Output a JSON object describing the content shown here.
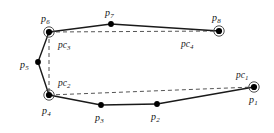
{
  "figure": {
    "kind": "polygon-with-control-points-diagram",
    "width": 274,
    "height": 133,
    "background_color": "#ffffff",
    "stroke_color": "#1a1a1a",
    "dash_color": "#555555",
    "vertex_fill": "#000000",
    "ring_stroke": "#4d4d4d"
  },
  "vertices": [
    {
      "id": "p1",
      "label": "p",
      "sub": "1",
      "x": 254,
      "y": 87,
      "ringed": true,
      "label_x": 249,
      "label_y": 95,
      "label_anchor": "below-left"
    },
    {
      "id": "p2",
      "label": "p",
      "sub": "2",
      "x": 157,
      "y": 104,
      "ringed": false,
      "label_x": 151,
      "label_y": 112,
      "label_anchor": "below"
    },
    {
      "id": "p3",
      "label": "p",
      "sub": "3",
      "x": 101,
      "y": 105,
      "ringed": false,
      "label_x": 95,
      "label_y": 113,
      "label_anchor": "below"
    },
    {
      "id": "p4",
      "label": "p",
      "sub": "4",
      "x": 49,
      "y": 95,
      "ringed": true,
      "label_x": 42,
      "label_y": 106,
      "label_anchor": "below"
    },
    {
      "id": "p5",
      "label": "p",
      "sub": "5",
      "x": 38,
      "y": 62,
      "ringed": false,
      "label_x": 20,
      "label_y": 60,
      "label_anchor": "left"
    },
    {
      "id": "p6",
      "label": "p",
      "sub": "6",
      "x": 49,
      "y": 32,
      "ringed": true,
      "label_x": 41,
      "label_y": 14,
      "label_anchor": "above"
    },
    {
      "id": "p7",
      "label": "p",
      "sub": "7",
      "x": 111,
      "y": 24,
      "ringed": false,
      "label_x": 105,
      "label_y": 8,
      "label_anchor": "above"
    },
    {
      "id": "p8",
      "label": "p",
      "sub": "8",
      "x": 219,
      "y": 31,
      "ringed": true,
      "label_x": 212,
      "label_y": 13,
      "label_anchor": "above"
    }
  ],
  "control_labels": [
    {
      "id": "pc1",
      "label": "pc",
      "sub": "1",
      "x": 236,
      "y": 71
    },
    {
      "id": "pc2",
      "label": "pc",
      "sub": "2",
      "x": 58,
      "y": 79
    },
    {
      "id": "pc3",
      "label": "pc",
      "sub": "3",
      "x": 58,
      "y": 41
    },
    {
      "id": "pc4",
      "label": "pc",
      "sub": "4",
      "x": 181,
      "y": 40
    }
  ],
  "solid_edges": [
    {
      "id": "edge-p6-p7",
      "from": "p6",
      "to": "p7"
    },
    {
      "id": "edge-p7-p8",
      "from": "p7",
      "to": "p8"
    },
    {
      "id": "edge-p6-p5",
      "from": "p6",
      "to": "p5"
    },
    {
      "id": "edge-p5-p4",
      "from": "p5",
      "to": "p4"
    },
    {
      "id": "edge-p4-p3",
      "from": "p4",
      "to": "p3"
    },
    {
      "id": "edge-p3-p2",
      "from": "p3",
      "to": "p2"
    },
    {
      "id": "edge-p2-p1",
      "from": "p2",
      "to": "p1"
    }
  ],
  "dashed_edges": [
    {
      "id": "chord-p6-p8",
      "from": "p6",
      "to": "p8"
    },
    {
      "id": "chord-p4-p1",
      "from": "p4",
      "to": "p1"
    },
    {
      "id": "chord-p6-p4",
      "from": "p6",
      "to": "p4"
    }
  ]
}
